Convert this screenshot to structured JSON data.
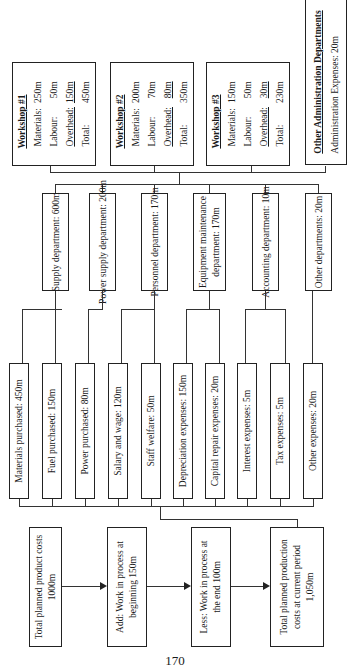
{
  "workshops": [
    {
      "title": "Workshop #1",
      "materials_label": "Materials:",
      "materials": "250m",
      "labour_label": "Labour:",
      "labour": "50m",
      "overhead_label": "Overhead:",
      "overhead": "150m",
      "total_label": "Total:",
      "total": "450m"
    },
    {
      "title": "Workshop #2",
      "materials_label": "Materials:",
      "materials": "200m",
      "labour_label": "Labour:",
      "labour": "70m",
      "overhead_label": "Overhead:",
      "overhead": "80m",
      "total_label": "Total:",
      "total": "350m"
    },
    {
      "title": "Workshop #3",
      "materials_label": "Materials:",
      "materials": "150m",
      "labour_label": "Labour:",
      "labour": "50m",
      "overhead_label": "Overhead:",
      "overhead": "30m",
      "total_label": "Total:",
      "total": "230m"
    }
  ],
  "admin": {
    "title": "Other Administration Departments",
    "line": "Administration Expenses:  20m"
  },
  "departments": [
    {
      "line1": "Supply department:  600m",
      "line2": ""
    },
    {
      "line1": "Power supply department: 200m",
      "line2": ""
    },
    {
      "line1": "Personnel department: 170m",
      "line2": ""
    },
    {
      "line1": "Equipment maintenance",
      "line2": "department:  170m"
    },
    {
      "line1": "Accounting department: 10m",
      "line2": ""
    },
    {
      "line1": "Other departments:  20m",
      "line2": ""
    }
  ],
  "expenses": [
    "Materials purchased:  450m",
    "Fuel purchased:  150m",
    "Power purchased:  80m",
    "Salary and wage:  120m",
    "Staff welfare:  50m",
    "Depreciation expenses:  150m",
    "Capital repair expenses: 20m",
    "Interest expenses:  5m",
    "Tax expenses:  5m",
    "Other expenses:  20m"
  ],
  "flow": [
    {
      "line1": "Total planned product costs",
      "line2": "1000m",
      "line3": ""
    },
    {
      "line1": "Add:  Work in process at",
      "line2": "beginning 150m",
      "line3": ""
    },
    {
      "line1": "Less:  Work in process at",
      "line2": "the end 100m",
      "line3": ""
    },
    {
      "line1": "Total planned production",
      "line2": "costs at current period",
      "line3": "1,050m"
    }
  ],
  "page_number": "170"
}
